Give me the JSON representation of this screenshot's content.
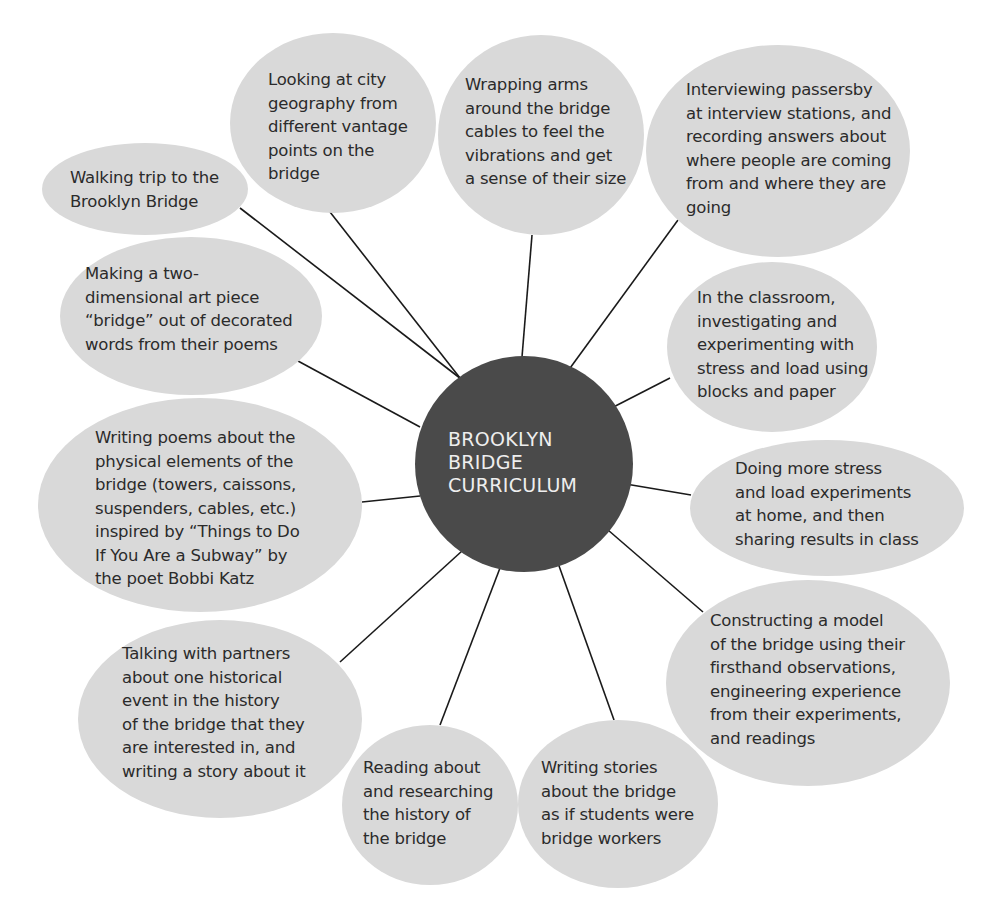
{
  "diagram": {
    "type": "mind-map",
    "colors": {
      "hub_fill": "#4a4a4a",
      "hub_text": "#eeeeee",
      "bubble_fill": "#d9d9d9",
      "bubble_text": "#2b2b2b",
      "connector": "#1a1a1a"
    },
    "hub": {
      "label": "BROOKLYN\nBRIDGE\nCURRICULUM"
    },
    "nodes": [
      {
        "id": "walking-trip",
        "label": "Walking trip to the\nBrooklyn Bridge"
      },
      {
        "id": "city-geography",
        "label": "Looking at city\ngeography from\ndifferent vantage\npoints on the\nbridge"
      },
      {
        "id": "wrapping-arms",
        "label": "Wrapping arms\naround the bridge\ncables to feel the\nvibrations and get\na sense of their size"
      },
      {
        "id": "interviewing",
        "label": "Interviewing passersby\nat interview stations, and\nrecording answers about\nwhere people are coming\nfrom and where they are\ngoing"
      },
      {
        "id": "art-piece",
        "label": "Making a two-\ndimensional art piece\n“bridge” out of decorated\nwords from their poems"
      },
      {
        "id": "classroom-experiments",
        "label": "In the classroom,\ninvestigating and\nexperimenting with\nstress and load using\nblocks and paper"
      },
      {
        "id": "writing-poems",
        "label": "Writing poems about the\nphysical elements of the\nbridge (towers, caissons,\nsuspenders, cables, etc.)\ninspired by “Things to Do\nIf You Are a Subway” by\nthe poet Bobbi Katz"
      },
      {
        "id": "home-experiments",
        "label": "Doing more stress\nand load experiments\nat home, and then\nsharing results in class"
      },
      {
        "id": "constructing-model",
        "label": "Constructing a model\nof the bridge using their\nfirsthand observations,\nengineering experience\nfrom their experiments,\nand readings"
      },
      {
        "id": "talking-partners",
        "label": "Talking with partners\nabout one historical\nevent in the history\nof the bridge that they\nare interested in, and\nwriting a story about it"
      },
      {
        "id": "reading-history",
        "label": "Reading about\nand researching\nthe history of\nthe bridge"
      },
      {
        "id": "writing-stories",
        "label": "Writing stories\nabout the bridge\nas if students were\nbridge workers"
      }
    ]
  }
}
